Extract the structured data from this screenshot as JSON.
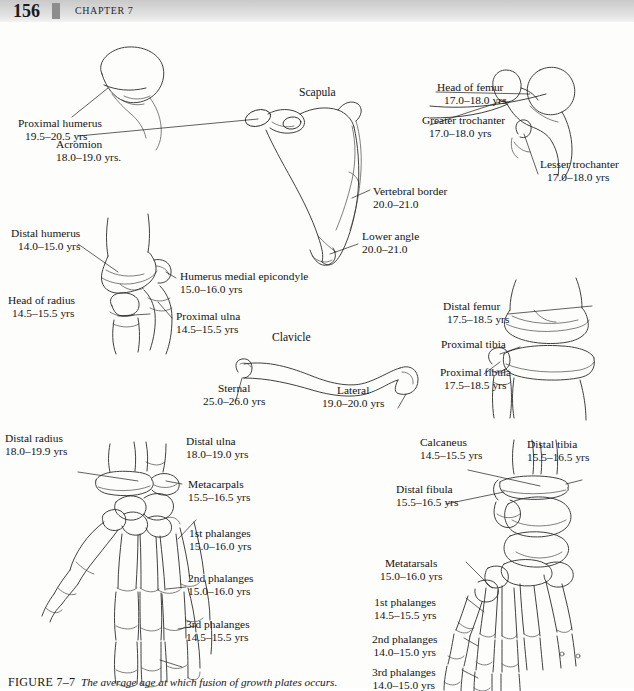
{
  "header": {
    "folio": "156",
    "chapter": "CHAPTER 7"
  },
  "figure": {
    "caption_label": "FIGURE 7–7",
    "caption_text": "The average age at which fusion of growth plates occurs."
  },
  "parts": {
    "scapula_title": "Scapula",
    "clavicle_title": "Clavicle"
  },
  "callouts": {
    "proximal_humerus": {
      "name": "Proximal humerus",
      "age": "19.5–20.5 yrs"
    },
    "acromion": {
      "name": "Acromion",
      "age": "18.0–19.0 yrs."
    },
    "vertebral_border": {
      "name": "Vertebral border",
      "age": "20.0–21.0"
    },
    "lower_angle": {
      "name": "Lower angle",
      "age": "20.0–21.0"
    },
    "head_of_femur": {
      "name": "Head of femur",
      "age": "17.0–18.0 yrs"
    },
    "greater_trochanter": {
      "name": "Greater trochanter",
      "age": "17.0–18.0 yrs"
    },
    "lesser_trochanter": {
      "name": "Lesser trochanter",
      "age": "17.0–18.0 yrs"
    },
    "distal_humerus": {
      "name": "Distal humerus",
      "age": "14.0–15.0 yrs"
    },
    "medial_epicondyle": {
      "name": "Humerus medial epicondyle",
      "age": "15.0–16.0 yrs"
    },
    "head_of_radius": {
      "name": "Head of radius",
      "age": "14.5–15.5 yrs"
    },
    "proximal_ulna": {
      "name": "Proximal ulna",
      "age": "14.5–15.5 yrs"
    },
    "distal_femur": {
      "name": "Distal femur",
      "age": "17.5–18.5 yrs"
    },
    "proximal_tibia": {
      "name": "Proximal tibia",
      "age": ""
    },
    "proximal_fibula": {
      "name": "Proximal fibula",
      "age": "17.5–18.5 yrs"
    },
    "sternal": {
      "name": "Sternal",
      "age": "25.0–26.0 yrs"
    },
    "lateral": {
      "name": "Lateral",
      "age": "19.0–20.0 yrs"
    },
    "distal_radius": {
      "name": "Distal radius",
      "age": "18.0–19.9 yrs"
    },
    "distal_ulna": {
      "name": "Distal ulna",
      "age": "18.0–19.0 yrs"
    },
    "metacarpals": {
      "name": "Metacarpals",
      "age": "15.5–16.5 yrs"
    },
    "hand_1st_phalanges": {
      "name": "1st phalanges",
      "age": "15.0–16.0 yrs"
    },
    "hand_2nd_phalanges": {
      "name": "2nd phalanges",
      "age": "15.0–16.0 yrs"
    },
    "hand_3rd_phalanges": {
      "name": "3rd phalanges",
      "age": "14.5–15.5 yrs"
    },
    "calcaneus": {
      "name": "Calcaneus",
      "age": "14.5–15.5 yrs"
    },
    "distal_tibia": {
      "name": "Distal tibia",
      "age": "15.5–16.5 yrs"
    },
    "distal_fibula": {
      "name": "Distal fibula",
      "age": "15.5–16.5 yrs"
    },
    "metatarsals": {
      "name": "Metatarsals",
      "age": "15.0–16.0 yrs"
    },
    "foot_1st_phalanges": {
      "name": "1st phalanges",
      "age": "14.5–15.5 yrs"
    },
    "foot_2nd_phalanges": {
      "name": "2nd phalanges",
      "age": "14.0–15.0 yrs"
    },
    "foot_3rd_phalanges": {
      "name": "3rd phalanges",
      "age": "14.0–15.0 yrs"
    }
  },
  "colors": {
    "ink": "#2b2b2b",
    "header_band": "#d6d6d6",
    "header_block": "#8d8d8d",
    "paper": "#fdfdfc"
  }
}
